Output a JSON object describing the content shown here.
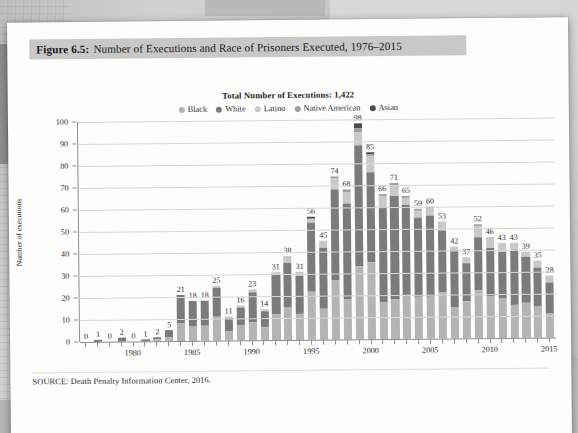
{
  "caption": {
    "figure_label": "Figure 6.5:",
    "text": "Number of Executions and Race of Prisoners Executed, 1976–2015"
  },
  "source": "SOURCE: Death Penalty Information Center, 2016.",
  "colors": {
    "black": "#b4b4b2",
    "white": "#7b7b79",
    "latino": "#c9c9c7",
    "native_american": "#a0a09e",
    "asian": "#4d4d4b",
    "gridline": "#d8d8d6",
    "axis": "#8d8e90",
    "caption_band": "#c8c8c6",
    "page": "#fdfdfc"
  },
  "chart_data": {
    "type": "bar",
    "title": "Total Number of Executions: 1,422",
    "xlabel": "",
    "ylabel": "Number of executions",
    "ylim": [
      0,
      100
    ],
    "yticks": [
      0,
      10,
      20,
      30,
      40,
      50,
      60,
      70,
      80,
      90,
      100
    ],
    "grid": true,
    "legend_position": "top",
    "stacked": true,
    "legend": [
      "Black",
      "White",
      "Latino",
      "Native American",
      "Asian"
    ],
    "xtick_labels": [
      "1980",
      "1985",
      "1990",
      "1995",
      "2000",
      "2005",
      "2010",
      "2015"
    ],
    "xtick_years": [
      1980,
      1985,
      1990,
      1995,
      2000,
      2005,
      2010,
      2015
    ],
    "categories": [
      1976,
      1977,
      1978,
      1979,
      1980,
      1981,
      1982,
      1983,
      1984,
      1985,
      1986,
      1987,
      1988,
      1989,
      1990,
      1991,
      1992,
      1993,
      1994,
      1995,
      1996,
      1997,
      1998,
      1999,
      2000,
      2001,
      2002,
      2003,
      2004,
      2005,
      2006,
      2007,
      2008,
      2009,
      2010,
      2011,
      2012,
      2013,
      2014,
      2015
    ],
    "totals": [
      0,
      1,
      0,
      2,
      0,
      1,
      2,
      5,
      21,
      18,
      18,
      25,
      11,
      16,
      23,
      14,
      31,
      38,
      31,
      56,
      45,
      74,
      68,
      98,
      85,
      66,
      71,
      65,
      59,
      60,
      53,
      42,
      37,
      52,
      46,
      43,
      43,
      39,
      35,
      28
    ],
    "series": [
      {
        "name": "Black",
        "values": [
          0,
          0,
          0,
          0,
          0,
          0,
          1,
          2,
          8,
          7,
          7,
          11,
          4,
          7,
          8,
          6,
          12,
          15,
          12,
          22,
          14,
          27,
          18,
          33,
          35,
          17,
          18,
          20,
          19,
          19,
          21,
          14,
          17,
          22,
          19,
          18,
          15,
          16,
          14,
          11
        ]
      },
      {
        "name": "White",
        "values": [
          0,
          1,
          0,
          2,
          0,
          1,
          1,
          3,
          13,
          11,
          11,
          13,
          6,
          8,
          14,
          7,
          18,
          20,
          17,
          31,
          28,
          41,
          44,
          55,
          41,
          43,
          47,
          41,
          36,
          37,
          28,
          26,
          17,
          24,
          22,
          21,
          25,
          21,
          18,
          14
        ]
      },
      {
        "name": "Latino",
        "values": [
          0,
          0,
          0,
          0,
          0,
          0,
          0,
          0,
          0,
          0,
          0,
          1,
          1,
          1,
          1,
          1,
          1,
          3,
          2,
          2,
          3,
          5,
          5,
          6,
          7,
          5,
          5,
          3,
          3,
          3,
          4,
          2,
          3,
          5,
          5,
          4,
          3,
          2,
          3,
          3
        ]
      },
      {
        "name": "Native American",
        "values": [
          0,
          0,
          0,
          0,
          0,
          0,
          0,
          0,
          0,
          0,
          0,
          0,
          0,
          0,
          0,
          0,
          0,
          0,
          0,
          0,
          0,
          1,
          1,
          2,
          1,
          1,
          1,
          1,
          1,
          1,
          0,
          0,
          0,
          1,
          0,
          0,
          0,
          0,
          0,
          0
        ]
      },
      {
        "name": "Asian",
        "values": [
          0,
          0,
          0,
          0,
          0,
          0,
          0,
          0,
          0,
          0,
          0,
          0,
          0,
          0,
          0,
          0,
          0,
          0,
          0,
          1,
          0,
          0,
          0,
          2,
          1,
          0,
          0,
          0,
          0,
          0,
          0,
          0,
          0,
          0,
          0,
          0,
          0,
          0,
          0,
          0
        ]
      }
    ]
  }
}
